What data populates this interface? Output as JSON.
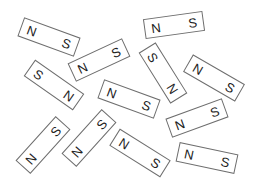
{
  "figure": {
    "border_color": "#6e6e6e",
    "label_color": "#222222",
    "magnets": [
      {
        "left": "N",
        "right": "S",
        "cx": 49,
        "cy": 37,
        "angle": 20
      },
      {
        "left": "N",
        "right": "S",
        "cx": 174,
        "cy": 25,
        "angle": -8
      },
      {
        "left": "N",
        "right": "S",
        "cx": 99,
        "cy": 60,
        "angle": -25
      },
      {
        "left": "S",
        "right": "N",
        "cx": 54,
        "cy": 85,
        "angle": 35
      },
      {
        "left": "S",
        "right": "N",
        "cx": 163,
        "cy": 73,
        "angle": 58
      },
      {
        "left": "N",
        "right": "S",
        "cx": 214,
        "cy": 78,
        "angle": 30
      },
      {
        "left": "N",
        "right": "S",
        "cx": 129,
        "cy": 99,
        "angle": 20
      },
      {
        "left": "N",
        "right": "S",
        "cx": 197,
        "cy": 118,
        "angle": -20
      },
      {
        "left": "N",
        "right": "S",
        "cx": 43,
        "cy": 145,
        "angle": -48
      },
      {
        "left": "N",
        "right": "S",
        "cx": 89,
        "cy": 138,
        "angle": -48
      },
      {
        "left": "N",
        "right": "S",
        "cx": 140,
        "cy": 153,
        "angle": 32
      },
      {
        "left": "N",
        "right": "S",
        "cx": 207,
        "cy": 158,
        "angle": 12
      }
    ]
  }
}
